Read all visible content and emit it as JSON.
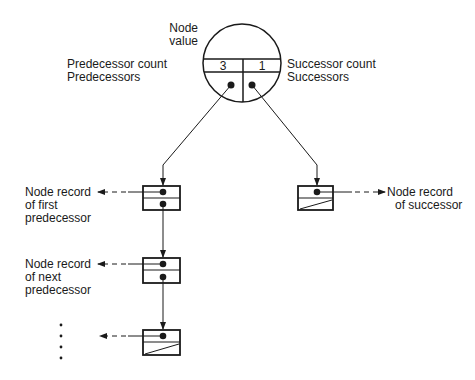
{
  "diagram": {
    "type": "node-record-structure",
    "colors": {
      "ink": "#1a1a1a",
      "background": "#ffffff"
    },
    "node": {
      "label_line1": "Node",
      "label_line2": "value",
      "predecessor_count_label": "Predecessor count",
      "predecessors_label": "Predecessors",
      "successor_count_label": "Successor count",
      "successors_label": "Successors",
      "predecessor_count": "3",
      "successor_count": "1"
    },
    "predecessor_list": [
      {
        "label_lines": [
          "Node record",
          "of first",
          "predecessor"
        ],
        "has_next": true
      },
      {
        "label_lines": [
          "Node record",
          "of next",
          "predecessor"
        ],
        "has_next": true
      },
      {
        "label_lines": [],
        "has_next": false,
        "continuation": "vertical-ellipsis"
      }
    ],
    "successor_list": [
      {
        "label_lines": [
          "Node record",
          "of successor"
        ],
        "has_next": false
      }
    ]
  }
}
